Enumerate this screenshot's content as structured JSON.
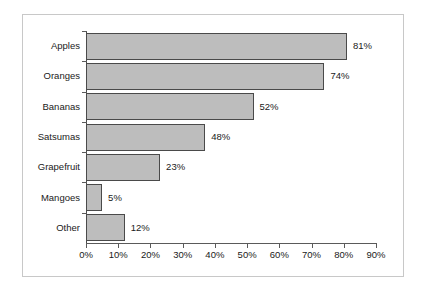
{
  "chart_data": {
    "type": "bar",
    "orientation": "horizontal",
    "title": "",
    "xlabel": "",
    "ylabel": "",
    "categories": [
      "Apples",
      "Oranges",
      "Bananas",
      "Satsumas",
      "Grapefruit",
      "Mangoes",
      "Other"
    ],
    "values": [
      81,
      74,
      52,
      48,
      23,
      5,
      12
    ],
    "value_labels": [
      "81%",
      "74%",
      "52%",
      "48%",
      "23%",
      "5%",
      "12%"
    ],
    "drawn_values": [
      81,
      74,
      52,
      37,
      23,
      5,
      12
    ],
    "xlim": [
      0,
      90
    ],
    "xticks": [
      0,
      10,
      20,
      30,
      40,
      50,
      60,
      70,
      80,
      90
    ],
    "xtick_labels": [
      "0%",
      "10%",
      "20%",
      "30%",
      "40%",
      "50%",
      "60%",
      "70%",
      "80%",
      "90%"
    ],
    "grid": false,
    "legend": false,
    "bar_color": "#bdbdbd",
    "bar_border_color": "#4a4a4a",
    "axis_color": "#5a5a5a",
    "frame_color": "#c8c8c8",
    "background_color": "#ffffff",
    "text_color": "#1a1a1a"
  }
}
